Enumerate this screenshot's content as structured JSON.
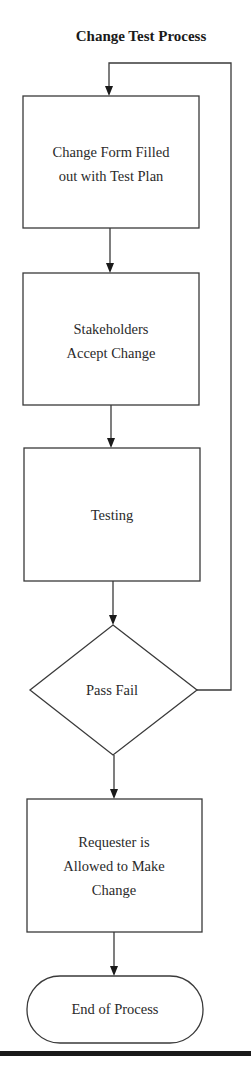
{
  "diagram": {
    "title": "Change Test Process",
    "nodes": [
      {
        "id": "n1",
        "type": "process",
        "lines": [
          "Change Form Filled",
          "out with Test Plan"
        ]
      },
      {
        "id": "n2",
        "type": "process",
        "lines": [
          "Stakeholders",
          "Accept Change"
        ]
      },
      {
        "id": "n3",
        "type": "process",
        "lines": [
          "Testing"
        ]
      },
      {
        "id": "n4",
        "type": "decision",
        "lines": [
          "Pass Fail"
        ]
      },
      {
        "id": "n5",
        "type": "process",
        "lines": [
          "Requester is",
          "Allowed to Make",
          "Change"
        ]
      },
      {
        "id": "n6",
        "type": "terminal",
        "lines": [
          "End of Process"
        ]
      }
    ],
    "edges": [
      {
        "from": "n1",
        "to": "n2"
      },
      {
        "from": "n2",
        "to": "n3"
      },
      {
        "from": "n3",
        "to": "n4"
      },
      {
        "from": "n4",
        "to": "n5",
        "label": ""
      },
      {
        "from": "n4",
        "to": "n1",
        "label": "",
        "route": "loop-right"
      },
      {
        "from": "n5",
        "to": "n6"
      }
    ],
    "colors": {
      "stroke": "#3a3a3a",
      "text": "#2a2a2a",
      "background": "#ffffff",
      "rule": "#1a1a1a"
    }
  }
}
